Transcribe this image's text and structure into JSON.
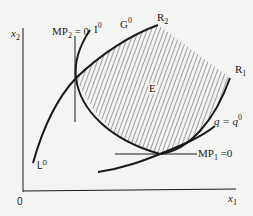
{
  "diagram": {
    "type": "economics isoquant diagram",
    "axes": {
      "y_label": "x",
      "y_label_sub": "2",
      "x_label": "x",
      "x_label_sub": "1",
      "origin": "0"
    },
    "labels": {
      "mp2_main": "MP",
      "mp2_sub": "2",
      "mp2_rest": " = 0",
      "i0_main": "I",
      "i0_sup": "0",
      "g0_main": "G",
      "g0_sup": "0",
      "r2_main": "R",
      "r2_sub": "2",
      "r1_main": "R",
      "r1_sub": "1",
      "e": "E",
      "q_main": "q = q",
      "q_sup": "0",
      "mp1_main": "MP",
      "mp1_sub": "1",
      "mp1_rest": " =0",
      "l0_main": "L",
      "l0_sup": "0"
    },
    "colors": {
      "line": "#1a1a1a",
      "background": "#f4f4f2",
      "hatch": "#333333"
    }
  }
}
